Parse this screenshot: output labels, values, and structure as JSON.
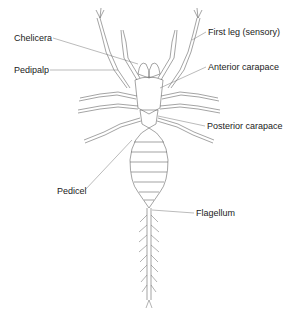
{
  "diagram": {
    "labels": [
      {
        "id": "chelicera",
        "text": "Chelicera",
        "x": 14,
        "y": 33
      },
      {
        "id": "pedipalp",
        "text": "Pedipalp",
        "x": 14,
        "y": 65
      },
      {
        "id": "first-leg",
        "text": "First leg (sensory)",
        "x": 208,
        "y": 27
      },
      {
        "id": "anterior-carapace",
        "text": "Anterior carapace",
        "x": 208,
        "y": 62
      },
      {
        "id": "posterior-carapace",
        "text": "Posterior carapace",
        "x": 207,
        "y": 121
      },
      {
        "id": "pedicel",
        "text": "Pedicel",
        "x": 57,
        "y": 186
      },
      {
        "id": "flagellum",
        "text": "Flagellum",
        "x": 196,
        "y": 208
      }
    ],
    "colors": {
      "line": "#555555",
      "text": "#222222",
      "background": "#ffffff"
    }
  }
}
